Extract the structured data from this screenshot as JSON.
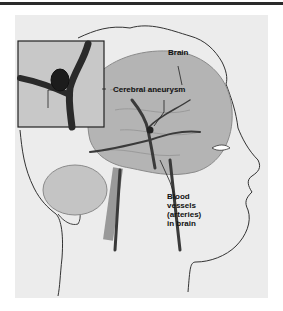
{
  "illustration": {
    "subject": "Cerebral aneurysm medical illustration",
    "style": "grayscale",
    "labels": {
      "brain": "Brain",
      "aneurysm": "Cerebral aneurysm",
      "vessels_line1": "Blood",
      "vessels_line2": "vessels",
      "vessels_line3": "(arteries)",
      "vessels_line4": "in brain"
    },
    "inset": {
      "depicts": "magnified aneurysm on artery branch"
    },
    "colors": {
      "background": "#ececec",
      "brain": "#b4b4b4",
      "vessel": "#3a3a3a",
      "outline": "#333333"
    }
  }
}
